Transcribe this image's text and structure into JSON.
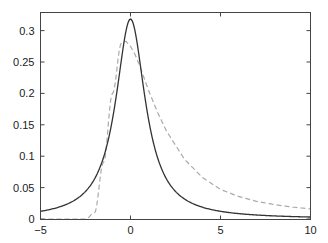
{
  "chart_data": {
    "type": "line",
    "title": "",
    "xlabel": "",
    "ylabel": "",
    "xlim": [
      -5,
      10
    ],
    "ylim": [
      0,
      0.33
    ],
    "grid": false,
    "legend": null,
    "x_ticks": [
      -5,
      0,
      5,
      10
    ],
    "x_tick_labels": [
      "-5",
      "0",
      "5",
      "10"
    ],
    "y_ticks": [
      0,
      0.05,
      0.1,
      0.15,
      0.2,
      0.25,
      0.3
    ],
    "y_tick_labels": [
      "0",
      "0.05",
      "0.1",
      "0.15",
      "0.2",
      "0.25",
      "0.3"
    ],
    "x": [
      -5,
      -4,
      -3,
      -2.5,
      -2,
      -1.5,
      -1,
      -0.5,
      -0.25,
      0,
      0.25,
      0.5,
      1,
      1.5,
      2,
      3,
      4,
      5,
      6,
      7,
      8,
      9,
      10
    ],
    "series": [
      {
        "name": "solid",
        "style": "solid",
        "color": "#333333",
        "values": [
          0.012,
          0.019,
          0.032,
          0.044,
          0.064,
          0.098,
          0.159,
          0.255,
          0.3,
          0.318,
          0.3,
          0.255,
          0.159,
          0.098,
          0.064,
          0.032,
          0.019,
          0.012,
          0.009,
          0.006,
          0.005,
          0.004,
          0.003
        ]
      },
      {
        "name": "dashed",
        "style": "dashed",
        "color": "#aaaaaa",
        "values": [
          0,
          0,
          0,
          0,
          0.01,
          0.09,
          0.2,
          0.28,
          0.283,
          0.275,
          0.262,
          0.245,
          0.205,
          0.17,
          0.14,
          0.095,
          0.066,
          0.047,
          0.036,
          0.028,
          0.023,
          0.019,
          0.016
        ]
      }
    ]
  }
}
